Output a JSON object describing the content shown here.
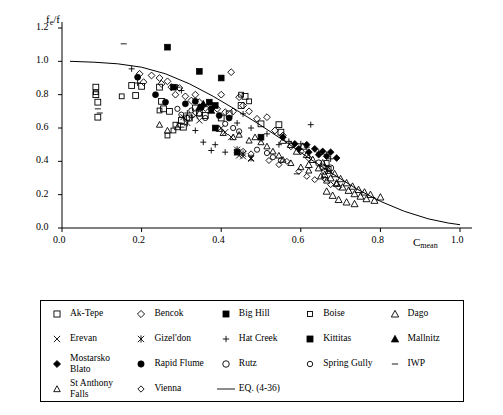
{
  "chart_data": {
    "type": "scatter",
    "title": "",
    "xlabel": "C_mean",
    "ylabel": "f_e/f",
    "xlim": [
      0.0,
      1.0
    ],
    "ylim": [
      0.0,
      1.2
    ],
    "xticks": [
      "0.0",
      "0.2",
      "0.4",
      "0.6",
      "0.8",
      "1.0"
    ],
    "yticks": [
      "0.0",
      "0.2",
      "0.4",
      "0.6",
      "0.8",
      "1.0",
      "1.2"
    ],
    "grid": false,
    "legend_position": "below-plot",
    "curve": {
      "name": "EQ. (4-36)",
      "points": [
        [
          0.02,
          1.0
        ],
        [
          0.08,
          0.995
        ],
        [
          0.14,
          0.985
        ],
        [
          0.2,
          0.965
        ],
        [
          0.26,
          0.925
        ],
        [
          0.32,
          0.865
        ],
        [
          0.38,
          0.79
        ],
        [
          0.44,
          0.705
        ],
        [
          0.5,
          0.615
        ],
        [
          0.56,
          0.52
        ],
        [
          0.62,
          0.42
        ],
        [
          0.68,
          0.325
        ],
        [
          0.74,
          0.235
        ],
        [
          0.8,
          0.16
        ],
        [
          0.86,
          0.1
        ],
        [
          0.92,
          0.055
        ],
        [
          0.97,
          0.03
        ],
        [
          1.0,
          0.02
        ]
      ]
    },
    "series": [
      {
        "name": "Ak-Tepe",
        "marker": "open-square",
        "points": [
          [
            0.085,
            0.845
          ],
          [
            0.085,
            0.8
          ],
          [
            0.09,
            0.755
          ],
          [
            0.09,
            0.665
          ],
          [
            0.175,
            0.855
          ],
          [
            0.185,
            0.795
          ],
          [
            0.2,
            0.85
          ],
          [
            0.245,
            0.845
          ],
          [
            0.25,
            0.76
          ],
          [
            0.255,
            0.715
          ],
          [
            0.27,
            0.7
          ],
          [
            0.3,
            0.645
          ],
          [
            0.305,
            0.605
          ],
          [
            0.32,
            0.66
          ],
          [
            0.335,
            0.72
          ],
          [
            0.345,
            0.69
          ],
          [
            0.36,
            0.675
          ],
          [
            0.4,
            0.66
          ],
          [
            0.42,
            0.685
          ],
          [
            0.45,
            0.735
          ],
          [
            0.46,
            0.79
          ],
          [
            0.5,
            0.625
          ],
          [
            0.545,
            0.62
          ],
          [
            0.55,
            0.575
          ]
        ]
      },
      {
        "name": "Bencok",
        "marker": "open-diamond",
        "points": [
          [
            0.195,
            0.925
          ],
          [
            0.205,
            0.875
          ],
          [
            0.225,
            0.915
          ],
          [
            0.245,
            0.9
          ],
          [
            0.25,
            0.865
          ],
          [
            0.265,
            0.88
          ],
          [
            0.275,
            0.845
          ],
          [
            0.285,
            0.8
          ],
          [
            0.295,
            0.84
          ],
          [
            0.31,
            0.79
          ],
          [
            0.325,
            0.765
          ],
          [
            0.335,
            0.8
          ],
          [
            0.345,
            0.755
          ],
          [
            0.36,
            0.72
          ],
          [
            0.375,
            0.74
          ],
          [
            0.39,
            0.715
          ],
          [
            0.4,
            0.8
          ],
          [
            0.41,
            0.695
          ],
          [
            0.425,
            0.935
          ],
          [
            0.43,
            0.7
          ],
          [
            0.445,
            0.785
          ],
          [
            0.455,
            0.735
          ],
          [
            0.47,
            0.7
          ],
          [
            0.49,
            0.655
          ],
          [
            0.515,
            0.665
          ],
          [
            0.535,
            0.585
          ],
          [
            0.555,
            0.555
          ],
          [
            0.575,
            0.49
          ],
          [
            0.6,
            0.46
          ],
          [
            0.62,
            0.42
          ]
        ]
      },
      {
        "name": "Big Hill",
        "marker": "filled-square",
        "points": [
          [
            0.265,
            1.085
          ],
          [
            0.345,
            0.94
          ],
          [
            0.4,
            0.9
          ],
          [
            0.385,
            0.6
          ],
          [
            0.44,
            0.455
          ]
        ]
      },
      {
        "name": "Boise",
        "marker": "open-square-small",
        "points": [
          [
            0.085,
            0.815
          ],
          [
            0.15,
            0.79
          ],
          [
            0.245,
            0.705
          ],
          [
            0.265,
            0.555
          ],
          [
            0.28,
            0.585
          ],
          [
            0.285,
            0.62
          ],
          [
            0.45,
            0.8
          ],
          [
            0.47,
            0.76
          ],
          [
            0.665,
            0.39
          ],
          [
            0.67,
            0.355
          ]
        ]
      },
      {
        "name": "Dago",
        "marker": "open-triangle",
        "points": [
          [
            0.555,
            0.525
          ],
          [
            0.575,
            0.5
          ],
          [
            0.59,
            0.46
          ],
          [
            0.605,
            0.49
          ],
          [
            0.615,
            0.44
          ],
          [
            0.62,
            0.38
          ],
          [
            0.63,
            0.41
          ],
          [
            0.645,
            0.36
          ],
          [
            0.655,
            0.39
          ],
          [
            0.66,
            0.32
          ],
          [
            0.67,
            0.345
          ],
          [
            0.675,
            0.3
          ],
          [
            0.685,
            0.325
          ],
          [
            0.69,
            0.27
          ],
          [
            0.7,
            0.295
          ],
          [
            0.705,
            0.245
          ],
          [
            0.715,
            0.27
          ],
          [
            0.72,
            0.225
          ],
          [
            0.73,
            0.25
          ],
          [
            0.735,
            0.205
          ],
          [
            0.745,
            0.23
          ],
          [
            0.75,
            0.19
          ],
          [
            0.76,
            0.215
          ],
          [
            0.765,
            0.175
          ],
          [
            0.775,
            0.2
          ],
          [
            0.785,
            0.165
          ],
          [
            0.8,
            0.185
          ],
          [
            0.665,
            0.22
          ],
          [
            0.68,
            0.195
          ],
          [
            0.695,
            0.17
          ],
          [
            0.715,
            0.155
          ],
          [
            0.735,
            0.145
          ]
        ]
      },
      {
        "name": "Erevan",
        "marker": "cross-x",
        "points": [
          [
            0.335,
            0.675
          ],
          [
            0.345,
            0.645
          ],
          [
            0.4,
            0.6
          ],
          [
            0.41,
            0.575
          ],
          [
            0.425,
            0.545
          ],
          [
            0.445,
            0.435
          ],
          [
            0.455,
            0.43
          ],
          [
            0.475,
            0.415
          ]
        ]
      },
      {
        "name": "Gizel'don",
        "marker": "asterisk",
        "points": [
          [
            0.305,
            0.665
          ],
          [
            0.315,
            0.63
          ],
          [
            0.44,
            0.47
          ],
          [
            0.455,
            0.445
          ],
          [
            0.475,
            0.42
          ]
        ]
      },
      {
        "name": "Hat Creek",
        "marker": "plus",
        "points": [
          [
            0.175,
            0.955
          ],
          [
            0.19,
            0.87
          ],
          [
            0.29,
            0.845
          ],
          [
            0.3,
            0.825
          ],
          [
            0.315,
            0.69
          ],
          [
            0.325,
            0.665
          ],
          [
            0.335,
            0.585
          ],
          [
            0.355,
            0.515
          ],
          [
            0.375,
            0.465
          ],
          [
            0.385,
            0.5
          ],
          [
            0.41,
            0.455
          ],
          [
            0.44,
            0.63
          ],
          [
            0.455,
            0.685
          ],
          [
            0.475,
            0.6
          ],
          [
            0.5,
            0.535
          ],
          [
            0.515,
            0.565
          ],
          [
            0.545,
            0.5
          ],
          [
            0.57,
            0.52
          ],
          [
            0.6,
            0.505
          ],
          [
            0.615,
            0.485
          ],
          [
            0.625,
            0.62
          ],
          [
            0.645,
            0.455
          ],
          [
            0.665,
            0.44
          ],
          [
            0.675,
            0.415
          ]
        ]
      },
      {
        "name": "Kittitas",
        "marker": "filled-square",
        "points": [
          [
            0.28,
            0.845
          ],
          [
            0.37,
            0.755
          ],
          [
            0.385,
            0.735
          ],
          [
            0.5,
            0.545
          ]
        ]
      },
      {
        "name": "Mallnitz",
        "marker": "filled-triangle",
        "points": [
          [
            0.345,
            0.725
          ],
          [
            0.355,
            0.745
          ],
          [
            0.375,
            0.705
          ]
        ]
      },
      {
        "name": "Mostarsko Blato",
        "marker": "filled-diamond",
        "points": [
          [
            0.555,
            0.545
          ],
          [
            0.585,
            0.505
          ],
          [
            0.595,
            0.475
          ],
          [
            0.615,
            0.5
          ],
          [
            0.62,
            0.455
          ],
          [
            0.635,
            0.475
          ],
          [
            0.645,
            0.44
          ],
          [
            0.655,
            0.46
          ],
          [
            0.665,
            0.43
          ],
          [
            0.675,
            0.455
          ],
          [
            0.69,
            0.42
          ]
        ]
      },
      {
        "name": "Rapid Flume",
        "marker": "filled-circle",
        "points": [
          [
            0.19,
            0.905
          ],
          [
            0.235,
            0.8
          ],
          [
            0.26,
            0.755
          ],
          [
            0.31,
            0.745
          ],
          [
            0.335,
            0.76
          ],
          [
            0.35,
            0.725
          ],
          [
            0.375,
            0.715
          ],
          [
            0.395,
            0.675
          ],
          [
            0.42,
            0.66
          ]
        ]
      },
      {
        "name": "Rutz",
        "marker": "open-circle",
        "points": [
          [
            0.645,
            0.39
          ],
          [
            0.655,
            0.365
          ],
          [
            0.66,
            0.34
          ],
          [
            0.675,
            0.36
          ]
        ]
      },
      {
        "name": "Spring Gully",
        "marker": "open-circle-small",
        "points": [
          [
            0.29,
            0.715
          ],
          [
            0.3,
            0.68
          ],
          [
            0.315,
            0.66
          ],
          [
            0.325,
            0.705
          ],
          [
            0.345,
            0.685
          ],
          [
            0.36,
            0.66
          ],
          [
            0.41,
            0.625
          ],
          [
            0.43,
            0.6
          ],
          [
            0.445,
            0.58
          ],
          [
            0.49,
            0.47
          ],
          [
            0.515,
            0.45
          ],
          [
            0.53,
            0.425
          ],
          [
            0.55,
            0.405
          ]
        ]
      },
      {
        "name": "IWP",
        "marker": "dash",
        "points": [
          [
            0.09,
            0.715
          ],
          [
            0.095,
            0.69
          ],
          [
            0.155,
            1.105
          ],
          [
            0.295,
            0.63
          ],
          [
            0.3,
            0.605
          ],
          [
            0.59,
            0.325
          ]
        ]
      },
      {
        "name": "St Anthony Falls",
        "marker": "open-triangle-small",
        "points": [
          [
            0.245,
            0.62
          ],
          [
            0.265,
            0.585
          ],
          [
            0.29,
            0.605
          ],
          [
            0.395,
            0.595
          ],
          [
            0.405,
            0.57
          ],
          [
            0.43,
            0.545
          ],
          [
            0.445,
            0.56
          ],
          [
            0.47,
            0.525
          ],
          [
            0.485,
            0.545
          ],
          [
            0.5,
            0.515
          ],
          [
            0.515,
            0.49
          ],
          [
            0.53,
            0.46
          ],
          [
            0.545,
            0.435
          ],
          [
            0.555,
            0.41
          ],
          [
            0.575,
            0.39
          ],
          [
            0.6,
            0.365
          ],
          [
            0.62,
            0.345
          ],
          [
            0.65,
            0.31
          ],
          [
            0.665,
            0.285
          ],
          [
            0.69,
            0.265
          ]
        ]
      },
      {
        "name": "Vienna",
        "marker": "open-diamond-small",
        "points": [
          [
            0.455,
            0.46
          ],
          [
            0.475,
            0.445
          ],
          [
            0.52,
            0.405
          ],
          [
            0.545,
            0.38
          ],
          [
            0.565,
            0.4
          ],
          [
            0.595,
            0.34
          ],
          [
            0.615,
            0.31
          ],
          [
            0.635,
            0.29
          ],
          [
            0.66,
            0.295
          ],
          [
            0.675,
            0.26
          ],
          [
            0.695,
            0.245
          ]
        ]
      }
    ]
  },
  "axes": {
    "y_label_main": "f",
    "y_label_sub": "e",
    "y_label_tail": "/f",
    "x_label_main": "C",
    "x_label_sub": "mean"
  },
  "legend": {
    "items": [
      {
        "label": "Ak-Tepe",
        "marker": "open-square"
      },
      {
        "label": "Bencok",
        "marker": "open-diamond"
      },
      {
        "label": "Big Hill",
        "marker": "filled-square"
      },
      {
        "label": "Boise",
        "marker": "open-square-small"
      },
      {
        "label": "Dago",
        "marker": "open-triangle"
      },
      {
        "label": "Erevan",
        "marker": "cross-x"
      },
      {
        "label": "Gizel'don",
        "marker": "asterisk"
      },
      {
        "label": "Hat Creek",
        "marker": "plus"
      },
      {
        "label": "Kittitas",
        "marker": "filled-square"
      },
      {
        "label": "Mallnitz",
        "marker": "filled-triangle"
      },
      {
        "label": "Mostarsko\nBlato",
        "marker": "filled-diamond"
      },
      {
        "label": "Rapid Flume",
        "marker": "filled-circle"
      },
      {
        "label": "Rutz",
        "marker": "open-circle"
      },
      {
        "label": "Spring Gully",
        "marker": "open-circle-small"
      },
      {
        "label": "IWP",
        "marker": "dash"
      },
      {
        "label": "St Anthony\nFalls",
        "marker": "open-triangle-small"
      },
      {
        "label": "Vienna",
        "marker": "open-diamond-small"
      },
      {
        "label": "EQ. (4-36)",
        "marker": "line"
      }
    ]
  },
  "colors": {
    "foreground": "#000000",
    "background": "#ffffff"
  }
}
